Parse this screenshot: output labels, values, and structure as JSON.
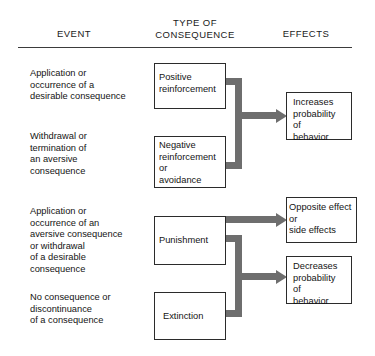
{
  "headers": {
    "event": "EVENT",
    "type_of_consequence": "TYPE OF\nCONSEQUENCE",
    "effects": "EFFECTS"
  },
  "rows": [
    {
      "event": "Application or\noccurrence of a\ndesirable consequence",
      "consequence": "Positive\nreinforcement",
      "effect": "Increases\nprobability\nof\nbehavior"
    },
    {
      "event": "Withdrawal or\ntermination of\nan aversive\nconsequence",
      "consequence": "Negative\nreinforcement\nor\navoidance",
      "effect": "Increases\nprobability\nof\nbehavior"
    },
    {
      "event": "Application or\noccurrence of an\naversive consequence\nor withdrawal\nof a desirable\nconsequence",
      "consequence": "Punishment",
      "effect": "Opposite effect\nor\nside effects"
    },
    {
      "event": "No consequence or\ndiscontinuance\nof a consequence",
      "consequence": "Extinction",
      "effect": "Decreases\nprobability\nof\nbehavior"
    }
  ],
  "effect_boxes": {
    "increases": "Increases\nprobability\nof\nbehavior",
    "opposite": "Opposite effect\nor\nside effects",
    "decreases": "Decreases\nprobability\nof\nbehavior"
  },
  "colors": {
    "text": "#141414",
    "box_border": "#2b2b2b",
    "connector": "#6e6e6e",
    "rule": "#3b3b3b",
    "background": "#ffffff"
  }
}
